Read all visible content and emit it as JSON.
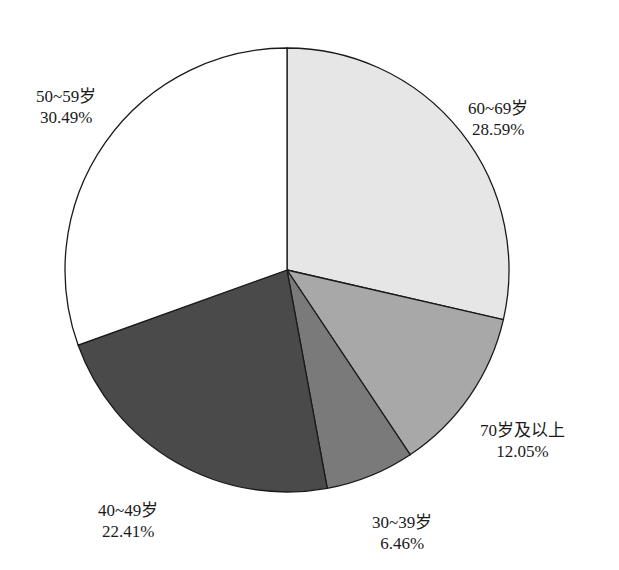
{
  "chart_data": {
    "type": "pie",
    "title": "",
    "categories": [
      "60~69岁",
      "70岁及以上",
      "30~39岁",
      "40~49岁",
      "50~59岁"
    ],
    "values": [
      28.59,
      12.05,
      6.46,
      22.41,
      30.49
    ],
    "value_labels": [
      "28.59%",
      "12.05%",
      "6.46%",
      "22.41%",
      "30.49%"
    ],
    "colors": [
      "#e6e6e6",
      "#a8a8a8",
      "#7a7a7a",
      "#4a4a4a",
      "#ffffff"
    ],
    "start_angle": "12 o'clock, clockwise",
    "legend": "none (labels beside slices)"
  },
  "labels": {
    "s60": {
      "name": "60~69岁",
      "pct": "28.59%"
    },
    "s70": {
      "name": "70岁及以上",
      "pct": "12.05%"
    },
    "s30": {
      "name": "30~39岁",
      "pct": "6.46%"
    },
    "s40": {
      "name": "40~49岁",
      "pct": "22.41%"
    },
    "s50": {
      "name": "50~59岁",
      "pct": "30.49%"
    }
  }
}
